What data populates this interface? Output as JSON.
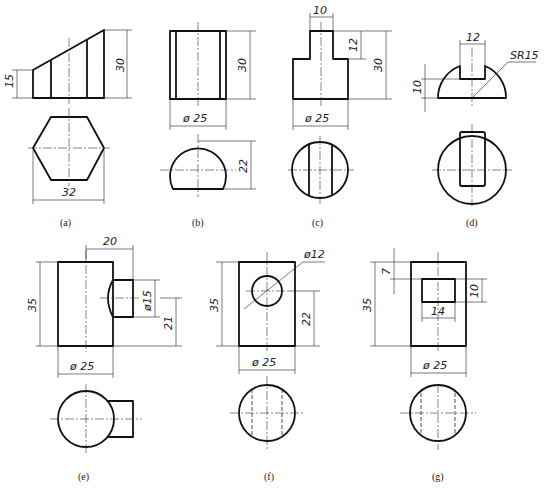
{
  "figure": {
    "type": "engineering-drawing",
    "panels": [
      {
        "id": "a",
        "label": "(a)",
        "dims": {
          "h_low": "15",
          "h_high": "30",
          "width": "32"
        },
        "views": [
          "front: sloped prism",
          "top: hexagon"
        ]
      },
      {
        "id": "b",
        "label": "(b)",
        "dims": {
          "height": "30",
          "diameter": "ø 25",
          "cut": "22"
        },
        "views": [
          "front: cylinder with flat",
          "top: truncated circle"
        ]
      },
      {
        "id": "c",
        "label": "(c)",
        "dims": {
          "slot_width": "10",
          "slot_depth": "12",
          "height": "30",
          "diameter": "ø 25"
        },
        "views": [
          "front: stepped cylinder",
          "top: circle with flats"
        ]
      },
      {
        "id": "d",
        "label": "(d)",
        "dims": {
          "slot_width": "12",
          "slot_depth": "10",
          "sphere_radius": "SR15"
        },
        "views": [
          "front: hemisphere with slot",
          "top: circle with slot"
        ]
      },
      {
        "id": "e",
        "label": "(e)",
        "dims": {
          "offset": "20",
          "branch_diameter": "ø15",
          "branch_height": "21",
          "height": "35",
          "diameter": "ø 25"
        },
        "views": [
          "front: cylinder with side branch",
          "top: circle with branch"
        ]
      },
      {
        "id": "f",
        "label": "(f)",
        "dims": {
          "hole_diameter": "ø12",
          "hole_height": "22",
          "height": "35",
          "diameter": "ø 25"
        },
        "views": [
          "front: cylinder with cross hole",
          "top: circle with hidden hole"
        ]
      },
      {
        "id": "g",
        "label": "(g)",
        "dims": {
          "top_offset": "7",
          "window_height": "10",
          "window_width": "14",
          "height": "35",
          "diameter": "ø 25"
        },
        "views": [
          "front: cylinder with square window",
          "top: circle with hidden window"
        ]
      }
    ]
  }
}
